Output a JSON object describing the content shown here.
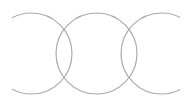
{
  "diagram": {
    "type": "overlapping-circles",
    "stroke_color": "#aaaaaa",
    "stroke_width": 1.2,
    "background": "#ffffff",
    "clip": {
      "x": 12,
      "y": 0,
      "width": 168,
      "height": 107
    },
    "circles": [
      {
        "id": "left",
        "cx": 31.5,
        "cy": 53.5,
        "r": 40.5
      },
      {
        "id": "middle",
        "cx": 96.5,
        "cy": 53.5,
        "r": 40.5
      },
      {
        "id": "right",
        "cx": 161.5,
        "cy": 53.5,
        "r": 40.5
      }
    ]
  }
}
